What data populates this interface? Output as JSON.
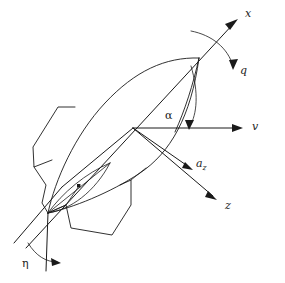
{
  "figure": {
    "type": "technical-line-diagram",
    "background_color": "#ffffff",
    "line_color": "#1a1a1a"
  },
  "labels": {
    "x_axis": "x",
    "q_rotation": "q",
    "v_axis": "v",
    "alpha_angle": "α",
    "az_vector_base": "a",
    "az_vector_sub": "z",
    "z_axis": "z",
    "eta_angle": "η"
  },
  "elements": {
    "center_marker": "circled-cross-center-of-gravity",
    "body": "missile-fuselage-outline",
    "fins": [
      "upper-left-fin",
      "lower-left-fin",
      "lower-right-fin",
      "forward-fin"
    ],
    "nose_point": "nose-tip",
    "tail_point": "tail-tip",
    "inner_lens": "control-surface-lens",
    "inner_dot": "control-surface-pivot-dot"
  },
  "vectors": [
    {
      "name": "x",
      "direction": "up-right",
      "label": "x"
    },
    {
      "name": "v",
      "direction": "right-horizontal",
      "label": "v"
    },
    {
      "name": "a_z",
      "direction": "down-right-short",
      "label": "a_z"
    },
    {
      "name": "z",
      "direction": "down-right-long",
      "label": "z"
    }
  ],
  "angles": [
    {
      "name": "alpha",
      "label": "α",
      "between": [
        "v",
        "x"
      ]
    },
    {
      "name": "eta",
      "label": "η",
      "between": [
        "z-axis-extension",
        "fin-deflection-line"
      ]
    },
    {
      "name": "q",
      "label": "q",
      "about": "x-axis",
      "type": "rotation-arc"
    }
  ]
}
